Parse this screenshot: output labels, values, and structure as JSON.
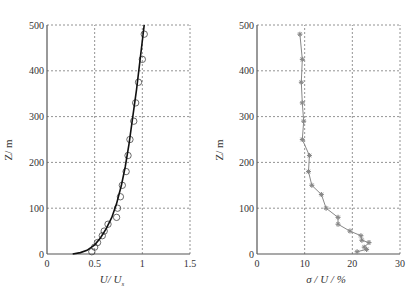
{
  "chart_data": [
    {
      "type": "line",
      "title": "",
      "xlabel": "U / U₀",
      "ylabel": "Z / m",
      "xlim": [
        0,
        1.5
      ],
      "ylim": [
        0,
        500
      ],
      "xticks": [
        0,
        0.5,
        1,
        1.5
      ],
      "xtick_labels": [
        "0",
        "0.5",
        "1",
        "1.5"
      ],
      "yticks": [
        0,
        100,
        200,
        300,
        400,
        500
      ],
      "ytick_labels": [
        "0",
        "100",
        "200",
        "300",
        "400",
        "500"
      ],
      "grid": true,
      "series": [
        {
          "name": "measured",
          "style": "circles",
          "x": [
            0.47,
            0.5,
            0.53,
            0.58,
            0.6,
            0.64,
            0.73,
            0.74,
            0.77,
            0.79,
            0.83,
            0.85,
            0.87,
            0.91,
            0.93,
            0.96,
            1.0,
            1.02
          ],
          "y": [
            5,
            15,
            25,
            40,
            50,
            65,
            80,
            100,
            125,
            150,
            180,
            215,
            250,
            290,
            330,
            375,
            425,
            480
          ]
        },
        {
          "name": "fit",
          "style": "solid-line",
          "x": [
            0.27,
            0.35,
            0.42,
            0.5,
            0.56,
            0.62,
            0.68,
            0.73,
            0.78,
            0.82,
            0.86,
            0.9,
            0.94,
            0.98,
            1.02
          ],
          "y": [
            0,
            3,
            8,
            20,
            35,
            55,
            80,
            110,
            150,
            190,
            240,
            300,
            360,
            430,
            500
          ]
        }
      ]
    },
    {
      "type": "line",
      "title": "",
      "xlabel": "σ / U / %",
      "ylabel": "Z / m",
      "xlim": [
        0,
        30
      ],
      "ylim": [
        0,
        500
      ],
      "xticks": [
        0,
        10,
        20,
        30
      ],
      "xtick_labels": [
        "0",
        "10",
        "20",
        "30"
      ],
      "yticks": [
        0,
        100,
        200,
        300,
        400,
        500
      ],
      "ytick_labels": [
        "0",
        "100",
        "200",
        "300",
        "400",
        "500"
      ],
      "grid": true,
      "series": [
        {
          "name": "turbulence intensity",
          "style": "line-with-star-markers",
          "x": [
            21,
            23,
            22.5,
            23.5,
            22,
            21.8,
            19.5,
            17,
            17,
            14.5,
            13.5,
            11.5,
            10.8,
            11,
            9.5,
            9.8,
            9.5,
            9.3,
            9.5,
            9
          ],
          "y": [
            5,
            10,
            15,
            25,
            30,
            40,
            50,
            65,
            80,
            100,
            130,
            150,
            180,
            215,
            250,
            290,
            330,
            375,
            425,
            480
          ]
        }
      ]
    }
  ],
  "labels": {
    "left_ylabel": "Z/ m",
    "left_xlabel_main": "U/ U",
    "left_xlabel_sub": "s",
    "right_ylabel": "Z/ m",
    "right_xlabel": "σ / U / %"
  },
  "colors": {
    "axis": "#555555",
    "grid": "#777777",
    "fit_line": "#111111",
    "circles": "#444444",
    "right_series": "#888888"
  }
}
